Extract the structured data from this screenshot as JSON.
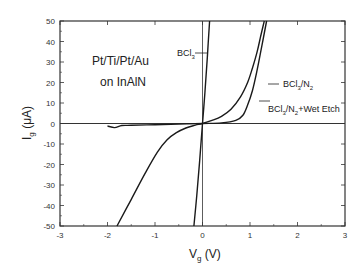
{
  "chart_data": {
    "type": "line",
    "title": "",
    "xlabel": "V",
    "xlabel_sub": "g",
    "xlabel_unit": " (V)",
    "ylabel": "I",
    "ylabel_sub": "g",
    "ylabel_unit": " (μA)",
    "xlim": [
      -3,
      3
    ],
    "ylim": [
      -50,
      50
    ],
    "xticks": [
      -3,
      -2,
      -1,
      0,
      1,
      2,
      3
    ],
    "yticks": [
      50,
      40,
      30,
      20,
      10,
      0,
      -10,
      -20,
      -30,
      -40,
      -50
    ],
    "grid": false,
    "annotation": [
      "Pt/Ti/Pt/Au",
      "on InAlN"
    ],
    "series": [
      {
        "name": "BCl3",
        "label_parts": [
          "BCl",
          "3",
          "",
          ""
        ],
        "x": [
          -0.18,
          -0.12,
          -0.06,
          0,
          0.05,
          0.1,
          0.15
        ],
        "y": [
          -50,
          -35,
          -18,
          0,
          15,
          32,
          50
        ]
      },
      {
        "name": "BCl3/N2",
        "label_parts": [
          "BCl",
          "3",
          "/N",
          "2"
        ],
        "x": [
          -1.8,
          -1.5,
          -1.2,
          -0.95,
          -0.75,
          -0.55,
          -0.35,
          -0.15,
          0,
          0.2,
          0.4,
          0.6,
          0.8,
          0.95,
          1.05,
          1.15,
          1.22,
          1.3
        ],
        "y": [
          -50,
          -37,
          -24,
          -14,
          -8,
          -4.5,
          -2.2,
          -0.8,
          0,
          1.5,
          3.5,
          7,
          13,
          20,
          27,
          35,
          42,
          50
        ]
      },
      {
        "name": "BCl3/N2+Wet Etch",
        "label_parts": [
          "BCl",
          "3",
          "/N",
          "2",
          "+Wet Etch"
        ],
        "x": [
          -2.0,
          -1.85,
          -1.7,
          -1.5,
          -1.0,
          -0.5,
          0,
          0.4,
          0.7,
          0.85,
          0.95,
          1.05,
          1.15,
          1.25,
          1.35
        ],
        "y": [
          -1.2,
          -2.0,
          -1.0,
          -0.9,
          -0.6,
          -0.3,
          0,
          0.3,
          1.5,
          4,
          9,
          16,
          26,
          38,
          50
        ]
      }
    ],
    "legend": "inline-arrows"
  }
}
